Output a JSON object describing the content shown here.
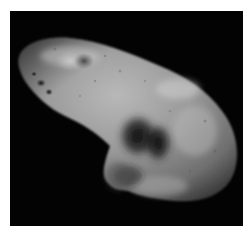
{
  "image": {
    "subject": "asteroid photograph",
    "description": "Grayscale photo of an elongated, cratered asteroid against black space",
    "colors": {
      "border": "#ffffff",
      "background": "#030303",
      "surface_light": "#b4b4b4",
      "surface_mid": "#8a8a8a",
      "surface_dark": "#2a2a2a"
    }
  }
}
